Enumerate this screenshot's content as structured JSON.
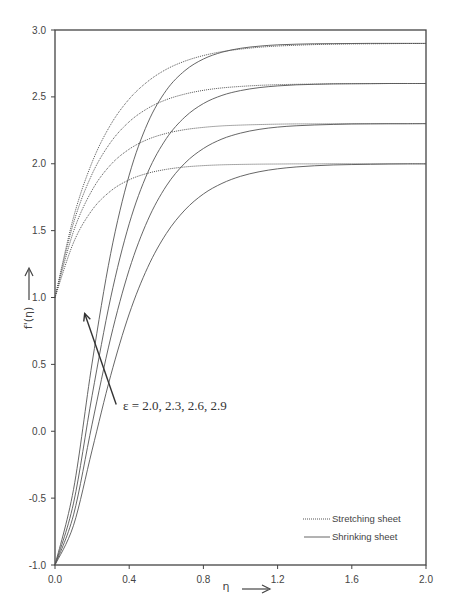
{
  "chart_data": {
    "type": "line",
    "title": "",
    "xlabel": "η",
    "ylabel": "f'(η)",
    "xlim": [
      0.0,
      2.0
    ],
    "ylim": [
      -1.0,
      3.0
    ],
    "grid": false,
    "legend_position": "bottom-right",
    "x_ticks": [
      "0.0",
      "0.4",
      "0.8",
      "1.2",
      "1.6",
      "2.0"
    ],
    "y_ticks": [
      "-1.0",
      "-0.5",
      "0.0",
      "0.5",
      "1.0",
      "1.5",
      "2.0",
      "2.5",
      "3.0"
    ],
    "x_tick_values": [
      0.0,
      0.4,
      0.8,
      1.2,
      1.6,
      2.0
    ],
    "y_tick_values": [
      -1.0,
      -0.5,
      0.0,
      0.5,
      1.0,
      1.5,
      2.0,
      2.5,
      3.0
    ],
    "annotation": "ε = 2.0, 2.3, 2.6, 2.9",
    "annotation_arrow": {
      "from": [
        0.33,
        0.2
      ],
      "to": [
        0.16,
        0.88
      ]
    },
    "x": [
      0.0,
      0.1,
      0.2,
      0.3,
      0.4,
      0.5,
      0.6,
      0.7,
      0.8,
      0.9,
      1.0,
      1.1,
      1.2,
      1.3,
      1.4,
      1.5,
      1.6,
      1.7,
      1.8,
      1.9,
      2.0
    ],
    "legend": [
      {
        "name": "Stretching sheet",
        "style": "dotted"
      },
      {
        "name": "Shrinking sheet",
        "style": "solid"
      }
    ],
    "series": [
      {
        "name": "Stretching sheet, ε=2.0",
        "style": "dotted",
        "values": [
          1.0,
          1.411,
          1.654,
          1.796,
          1.88,
          1.929,
          1.958,
          1.976,
          1.986,
          1.992,
          1.995,
          1.997,
          1.998,
          1.999,
          1.999,
          2.0,
          2.0,
          2.0,
          2.0,
          2.0,
          2.0
        ]
      },
      {
        "name": "Stretching sheet, ε=2.3",
        "style": "dotted",
        "values": [
          1.0,
          1.495,
          1.802,
          1.992,
          2.109,
          2.182,
          2.227,
          2.255,
          2.272,
          2.283,
          2.289,
          2.293,
          2.296,
          2.298,
          2.298,
          2.299,
          2.3,
          2.3,
          2.3,
          2.3,
          2.3
        ]
      },
      {
        "name": "Stretching sheet, ε=2.6",
        "style": "dotted",
        "values": [
          1.0,
          1.558,
          1.923,
          2.16,
          2.314,
          2.414,
          2.479,
          2.521,
          2.549,
          2.567,
          2.578,
          2.586,
          2.591,
          2.594,
          2.596,
          2.598,
          2.599,
          2.599,
          2.6,
          2.6,
          2.6
        ]
      },
      {
        "name": "Stretching sheet, ε=2.9",
        "style": "dotted",
        "values": [
          1.0,
          1.6,
          2.011,
          2.292,
          2.484,
          2.615,
          2.706,
          2.767,
          2.809,
          2.838,
          2.857,
          2.871,
          2.88,
          2.886,
          2.891,
          2.894,
          2.896,
          2.897,
          2.898,
          2.899,
          2.899
        ]
      },
      {
        "name": "Shrinking sheet, ε=2.0",
        "style": "solid",
        "values": [
          -1.0,
          -0.703,
          -0.141,
          0.415,
          0.877,
          1.226,
          1.478,
          1.654,
          1.774,
          1.853,
          1.906,
          1.94,
          1.962,
          1.976,
          1.985,
          1.991,
          1.994,
          1.996,
          1.998,
          1.999,
          1.999
        ]
      },
      {
        "name": "Shrinking sheet, ε=2.3",
        "style": "solid",
        "values": [
          -1.0,
          -0.625,
          0.053,
          0.697,
          1.208,
          1.578,
          1.834,
          2.004,
          2.114,
          2.185,
          2.229,
          2.257,
          2.274,
          2.284,
          2.29,
          2.294,
          2.297,
          2.298,
          2.299,
          2.299,
          2.3
        ]
      },
      {
        "name": "Shrinking sheet, ε=2.6",
        "style": "solid",
        "values": [
          -1.0,
          -0.537,
          0.267,
          0.997,
          1.551,
          1.935,
          2.188,
          2.349,
          2.45,
          2.511,
          2.547,
          2.569,
          2.582,
          2.59,
          2.594,
          2.597,
          2.598,
          2.599,
          2.6,
          2.6,
          2.6
        ]
      },
      {
        "name": "Shrinking sheet, ε=2.9",
        "style": "solid",
        "values": [
          -1.0,
          -0.434,
          0.51,
          1.328,
          1.915,
          2.305,
          2.549,
          2.696,
          2.783,
          2.834,
          2.863,
          2.879,
          2.889,
          2.894,
          2.897,
          2.898,
          2.899,
          2.9,
          2.9,
          2.9,
          2.9
        ]
      }
    ],
    "colors": {
      "axis": "#444444",
      "series": "#555555",
      "text": "#444444"
    }
  }
}
